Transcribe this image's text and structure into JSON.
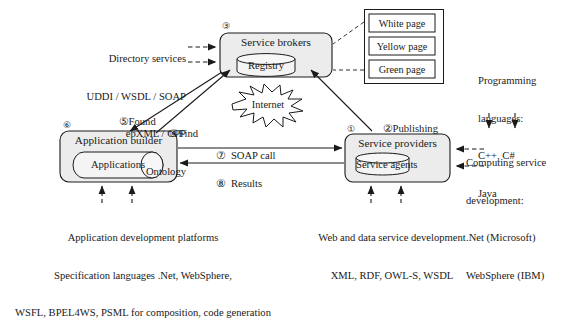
{
  "diagram": {
    "colors": {
      "stroke": "#1a1a1a",
      "box_fill": "#ececec",
      "cylinder_fill": "#f4f4f4",
      "page_fill": "#ffffff",
      "background": "#ffffff"
    }
  },
  "nodes": {
    "service_brokers": {
      "marker": "③",
      "title": "Service brokers",
      "cylinder": "Registry"
    },
    "service_providers": {
      "marker": "①",
      "title": "Service providers",
      "cylinder": "Service agents"
    },
    "application_builder": {
      "marker": "⑥",
      "title": "Application builder",
      "cylinder": "Applications"
    },
    "internet": {
      "label": "Internet"
    }
  },
  "pages_box": {
    "name": "registry-pages",
    "cells": [
      "White page",
      "Yellow page",
      "Green page"
    ]
  },
  "annotations": {
    "directory_services": {
      "lines": [
        "Directory services",
        "UDDI / WSDL / SOAP",
        "ebXML / CPP",
        "Ontology"
      ]
    },
    "programming_languages": {
      "lines": [
        "Programming",
        "languages:",
        "C++, C#",
        "Java"
      ]
    },
    "computing_service_development": {
      "lines": [
        "Computing service",
        "development:",
        ".Net (Microsoft)",
        "WebSphere (IBM)"
      ]
    },
    "application_development": {
      "lines": [
        "Application development platforms",
        "Specification languages .Net, WebSphere,",
        "WSFL, BPEL4WS, PSML for composition, code generation"
      ]
    },
    "web_data_service_development": {
      "lines": [
        "Web and data service development",
        "XML, RDF, OWL-S, WSDL"
      ]
    }
  },
  "flows": [
    {
      "id": "publishing",
      "marker": "②",
      "label": "Publishing",
      "from": "service_providers",
      "to": "service_brokers"
    },
    {
      "id": "find",
      "marker": "④",
      "label": "Find",
      "from": "application_builder",
      "to": "service_brokers"
    },
    {
      "id": "found",
      "marker": "⑤",
      "label": "Found",
      "from": "service_brokers",
      "to": "application_builder"
    },
    {
      "id": "soap-call",
      "marker": "⑦",
      "label": "SOAP call",
      "from": "application_builder",
      "to": "service_providers"
    },
    {
      "id": "results",
      "marker": "⑧",
      "label": "Results",
      "from": "service_providers",
      "to": "application_builder"
    }
  ]
}
